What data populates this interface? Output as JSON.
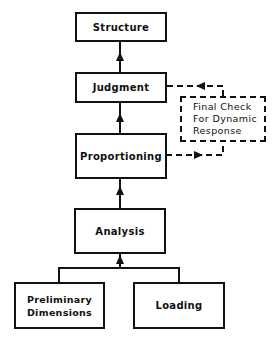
{
  "diagram": {
    "type": "flowchart",
    "nodes": {
      "structure": {
        "label": "Structure"
      },
      "judgment": {
        "label": "Judgment"
      },
      "final_check": {
        "line1": "Final Check",
        "line2": "For Dynamic",
        "line3": "Response",
        "style": "dashed"
      },
      "proportioning": {
        "label": "Proportioning"
      },
      "analysis": {
        "label": "Analysis"
      },
      "preliminary": {
        "line1": "Preliminary",
        "line2": "Dimensions"
      },
      "loading": {
        "label": "Loading"
      }
    },
    "edges": [
      {
        "from": "preliminary",
        "to": "analysis",
        "style": "solid"
      },
      {
        "from": "loading",
        "to": "analysis",
        "style": "solid"
      },
      {
        "from": "analysis",
        "to": "proportioning",
        "style": "solid"
      },
      {
        "from": "proportioning",
        "to": "final_check",
        "style": "dashed"
      },
      {
        "from": "final_check",
        "to": "judgment",
        "style": "dashed"
      },
      {
        "from": "proportioning",
        "to": "judgment",
        "style": "solid"
      },
      {
        "from": "judgment",
        "to": "structure",
        "style": "solid"
      }
    ]
  }
}
